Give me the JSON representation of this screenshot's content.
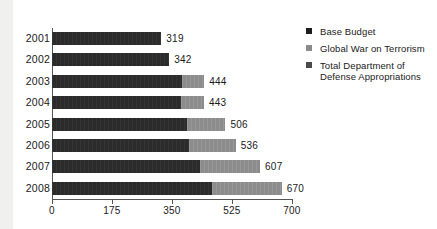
{
  "chart_data": {
    "type": "bar",
    "orientation": "horizontal",
    "stacked": true,
    "title": "",
    "subtitle": "",
    "xlabel": "",
    "ylabel": "",
    "categories": [
      "2001",
      "2002",
      "2003",
      "2004",
      "2005",
      "2006",
      "2007",
      "2008"
    ],
    "series": [
      {
        "name": "Base Budget",
        "color": "#2b2b2b",
        "values": [
          319,
          342,
          380,
          377,
          393,
          400,
          432,
          467
        ]
      },
      {
        "name": "Global War on Terrorism",
        "color": "#8c8c8c",
        "values": [
          0,
          0,
          64,
          66,
          113,
          136,
          175,
          203
        ]
      }
    ],
    "totals": [
      319,
      342,
      444,
      443,
      506,
      536,
      607,
      670
    ],
    "total_labels": [
      "319",
      "342",
      "444",
      "443",
      "506",
      "536",
      "607",
      "670"
    ],
    "xticks": [
      0,
      175,
      350,
      525,
      700
    ],
    "xtick_labels": [
      "0",
      "175",
      "350",
      "525",
      "700"
    ],
    "xlim": [
      0,
      700
    ],
    "grid": false,
    "legend_position": "right",
    "legend": [
      {
        "label": "Base Budget",
        "color": "#1c1c1c",
        "swatch": "legend-swatch-base-budget"
      },
      {
        "label": "Global War on Terrorism",
        "color": "#8c8c8c",
        "swatch": "legend-swatch-gwot"
      },
      {
        "label": "Total Department of Defense Appropriations",
        "color": "#4a4a4a",
        "swatch": "legend-swatch-total"
      }
    ],
    "legend_lines": [
      [
        "Base Budget"
      ],
      [
        "Global War on Terrorism"
      ],
      [
        "Total Department of",
        "Defense Appropriations"
      ]
    ]
  },
  "colors": {
    "base_budget": "#2b2b2b",
    "gwot": "#8c8c8c",
    "total": "#4a4a4a",
    "axis": "#555555",
    "text": "#1a1a1a",
    "background": "#ffffff",
    "left_band": "#f0f0ee"
  }
}
